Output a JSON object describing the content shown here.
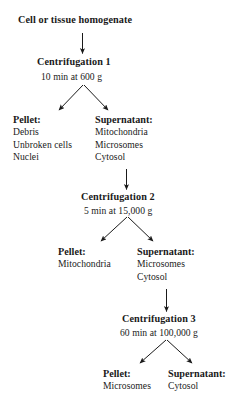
{
  "diagram": {
    "type": "flowchart",
    "title": "Cell or tissue homogenate",
    "colors": {
      "ink": "#1a1a1a",
      "background": "#ffffff"
    },
    "start": {
      "label": "Cell or tissue homogenate"
    },
    "steps": [
      {
        "id": "centrifugation-1",
        "header": "Centrifugation 1",
        "conditions": "10 min at 600 g",
        "pellet": {
          "label": "Pellet:",
          "contents": [
            "Debris",
            "Unbroken cells",
            "Nuclei"
          ]
        },
        "supernatant": {
          "label": "Supernatant:",
          "contents": [
            "Mitochondria",
            "Microsomes",
            "Cytosol"
          ]
        }
      },
      {
        "id": "centrifugation-2",
        "header": "Centrifugation 2",
        "conditions": "5 min at 15,000 g",
        "pellet": {
          "label": "Pellet:",
          "contents": [
            "Mitochondria"
          ]
        },
        "supernatant": {
          "label": "Supernatant:",
          "contents": [
            "Microsomes",
            "Cytosol"
          ]
        }
      },
      {
        "id": "centrifugation-3",
        "header": "Centrifugation 3",
        "conditions": "60 min at 100,000 g",
        "pellet": {
          "label": "Pellet:",
          "contents": [
            "Microsomes"
          ]
        },
        "supernatant": {
          "label": "Supernatant:",
          "contents": [
            "Cytosol"
          ]
        }
      }
    ]
  }
}
